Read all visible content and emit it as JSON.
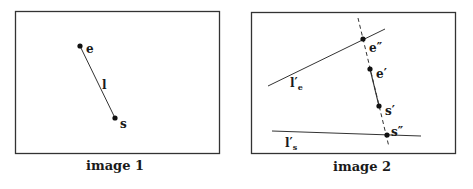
{
  "panels": [
    {
      "caption": "image 1",
      "points": [
        {
          "id": "e",
          "label": "e"
        },
        {
          "id": "s",
          "label": "s"
        }
      ],
      "segment_label": "l"
    },
    {
      "caption": "image 2",
      "points": [
        {
          "id": "e2",
          "label": "e″"
        },
        {
          "id": "e1",
          "label": "e′"
        },
        {
          "id": "s1",
          "label": "s′"
        },
        {
          "id": "s2",
          "label": "s″"
        }
      ],
      "line_labels": {
        "le": {
          "base": "l′",
          "sub": "e"
        },
        "ls": {
          "base": "l′",
          "sub": "s"
        }
      }
    }
  ],
  "colors": {
    "ink": "#1a1a1a",
    "frame": "#333333",
    "background": "#ffffff"
  }
}
